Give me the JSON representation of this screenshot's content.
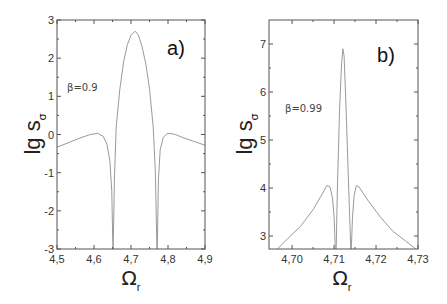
{
  "chart_data": [
    {
      "type": "line",
      "panel_label": "a)",
      "annotation": "β=0.9",
      "xlabel": "Ω",
      "xlabel_sub": "r",
      "ylabel": "lg s",
      "ylabel_sub": "σ",
      "xlim": [
        4.5,
        4.9
      ],
      "ylim": [
        -3,
        3
      ],
      "xticks": [
        4.5,
        4.6,
        4.7,
        4.8,
        4.9
      ],
      "xtick_labels": [
        "4,5",
        "4,6",
        "4,7",
        "4,8",
        "4,9"
      ],
      "yticks": [
        -3,
        -2,
        -1,
        0,
        1,
        2,
        3
      ],
      "ytick_labels": [
        "-3",
        "-2",
        "-1",
        "0",
        "1",
        "2",
        "3"
      ],
      "grid": false,
      "series": [
        {
          "name": "β=0.9",
          "x": [
            4.5,
            4.53,
            4.56,
            4.59,
            4.61,
            4.625,
            4.635,
            4.643,
            4.648,
            4.651,
            4.652,
            4.655,
            4.66,
            4.67,
            4.68,
            4.69,
            4.7,
            4.71,
            4.713,
            4.72,
            4.73,
            4.74,
            4.75,
            4.76,
            4.766,
            4.77,
            4.771,
            4.774,
            4.779,
            4.787,
            4.797,
            4.805,
            4.82,
            4.84,
            4.87,
            4.9
          ],
          "y": [
            -0.33,
            -0.22,
            -0.1,
            0.0,
            0.03,
            -0.05,
            -0.25,
            -0.7,
            -1.5,
            -3.0,
            -3.0,
            -1.2,
            0.2,
            1.2,
            1.9,
            2.35,
            2.6,
            2.7,
            2.69,
            2.6,
            2.3,
            1.85,
            1.2,
            0.2,
            -1.0,
            -3.0,
            -3.0,
            -1.2,
            -0.4,
            -0.08,
            0.02,
            0.03,
            0.0,
            -0.08,
            -0.18,
            -0.28
          ]
        }
      ]
    },
    {
      "type": "line",
      "panel_label": "b)",
      "annotation": "β=0.99",
      "xlabel": "Ω",
      "xlabel_sub": "r",
      "ylabel": "lg s",
      "ylabel_sub": "σ",
      "xlim": [
        4.6945,
        4.73
      ],
      "ylim": [
        2.73,
        7.5
      ],
      "xticks": [
        4.7,
        4.71,
        4.72,
        4.73
      ],
      "xtick_labels": [
        "4,70",
        "4,71",
        "4,72",
        "4,73"
      ],
      "yticks": [
        3,
        4,
        5,
        6,
        7
      ],
      "ytick_labels": [
        "3",
        "4",
        "5",
        "6",
        "7"
      ],
      "grid": false,
      "series": [
        {
          "name": "β=0.99",
          "x": [
            4.6965,
            4.699,
            4.702,
            4.705,
            4.707,
            4.7083,
            4.709,
            4.7096,
            4.71,
            4.7103,
            4.7105,
            4.7108,
            4.7113,
            4.7118,
            4.7121,
            4.7124,
            4.7129,
            4.7135,
            4.714,
            4.7141,
            4.7144,
            4.7148,
            4.7153,
            4.716,
            4.718,
            4.721,
            4.724,
            4.727,
            4.7295
          ],
          "y": [
            2.73,
            2.95,
            3.2,
            3.55,
            3.85,
            4.05,
            4.03,
            3.8,
            3.4,
            2.73,
            2.73,
            4.0,
            5.6,
            6.6,
            6.9,
            6.75,
            5.6,
            4.0,
            2.73,
            2.73,
            3.4,
            3.85,
            4.05,
            4.02,
            3.75,
            3.4,
            3.1,
            2.9,
            2.73
          ]
        }
      ]
    }
  ]
}
